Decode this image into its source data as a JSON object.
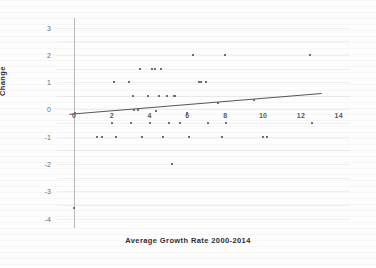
{
  "chart_data": {
    "type": "scatter",
    "title": "",
    "xlabel": "Average Growth Rate 2000-2014",
    "ylabel": "Change",
    "xlim": [
      -0.9,
      14.6
    ],
    "ylim": [
      -4.35,
      3.35
    ],
    "xticks": [
      "0",
      "2",
      "4",
      "6",
      "8",
      "10",
      "12",
      "14"
    ],
    "xtick_values": [
      0,
      2,
      4,
      6,
      8,
      10,
      12,
      14
    ],
    "yticks": [
      "3",
      "2",
      "1",
      "0",
      "-1",
      "-2",
      "-3",
      "-4"
    ],
    "ytick_values": [
      3,
      2,
      1,
      0,
      -1,
      -2,
      -3,
      -4
    ],
    "grid": "horizontal",
    "legend": "none",
    "marker": "small-gray-square",
    "points": [
      [
        0.0,
        -3.6
      ],
      [
        0.05,
        -0.12
      ],
      [
        1.2,
        -1.0
      ],
      [
        1.5,
        -1.0
      ],
      [
        2.0,
        -0.5
      ],
      [
        2.1,
        1.0
      ],
      [
        2.2,
        -1.0
      ],
      [
        2.9,
        1.0
      ],
      [
        3.0,
        -0.5
      ],
      [
        3.1,
        0.5
      ],
      [
        3.15,
        -0.02
      ],
      [
        3.4,
        -0.02
      ],
      [
        3.5,
        1.5
      ],
      [
        3.6,
        -1.0
      ],
      [
        3.9,
        0.5
      ],
      [
        4.0,
        -0.5
      ],
      [
        4.1,
        1.5
      ],
      [
        4.3,
        1.5
      ],
      [
        4.35,
        -0.07
      ],
      [
        4.5,
        0.5
      ],
      [
        4.6,
        1.5
      ],
      [
        4.7,
        -1.0
      ],
      [
        4.9,
        0.5
      ],
      [
        5.0,
        -0.5
      ],
      [
        5.2,
        -2.0
      ],
      [
        5.3,
        0.5
      ],
      [
        5.35,
        0.5
      ],
      [
        5.6,
        -0.5
      ],
      [
        6.0,
        -0.12
      ],
      [
        6.1,
        -1.0
      ],
      [
        6.3,
        2.0
      ],
      [
        6.6,
        1.0
      ],
      [
        6.7,
        1.0
      ],
      [
        7.0,
        1.0
      ],
      [
        7.1,
        -0.5
      ],
      [
        7.6,
        0.25
      ],
      [
        7.8,
        -1.0
      ],
      [
        8.0,
        2.0
      ],
      [
        8.05,
        -0.5
      ],
      [
        9.5,
        0.35
      ],
      [
        10.0,
        -1.0
      ],
      [
        10.2,
        -1.0
      ],
      [
        12.5,
        2.0
      ],
      [
        12.6,
        -0.5
      ]
    ],
    "trendline": {
      "x_start": -0.25,
      "y_start": -0.18,
      "x_end": 13.1,
      "y_end": 0.58
    }
  }
}
